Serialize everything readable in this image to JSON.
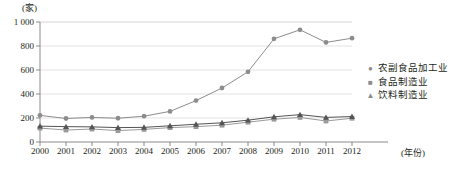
{
  "chart_data": {
    "type": "line",
    "title": "",
    "xlabel": "(年份)",
    "ylabel": "(家)",
    "categories": [
      "2000",
      "2001",
      "2002",
      "2003",
      "2004",
      "2005",
      "2006",
      "2007",
      "2008",
      "2009",
      "2010",
      "2011",
      "2012"
    ],
    "ylim": [
      0,
      1000
    ],
    "yticks": [
      "0",
      "200",
      "400",
      "600",
      "800",
      "1 000"
    ],
    "ytick_values": [
      0,
      200,
      400,
      600,
      800,
      1000
    ],
    "grid": true,
    "legend_position": "right",
    "series": [
      {
        "name": "农副食品加工业",
        "marker": "circle",
        "color": "#8d8d8d",
        "values": [
          222,
          196,
          205,
          198,
          215,
          255,
          345,
          450,
          585,
          860,
          935,
          830,
          865
        ]
      },
      {
        "name": "食品制造业",
        "marker": "square",
        "color": "#9a9a9a",
        "values": [
          116,
          100,
          108,
          95,
          105,
          120,
          128,
          140,
          165,
          190,
          205,
          175,
          198
        ]
      },
      {
        "name": "饮料制造业",
        "marker": "triangle",
        "color": "#555555",
        "values": [
          132,
          128,
          126,
          120,
          122,
          135,
          148,
          160,
          182,
          210,
          228,
          205,
          212
        ]
      }
    ]
  },
  "axis": {
    "y_unit_label": "(家)",
    "x_unit_label": "(年份)"
  },
  "legend": {
    "items": [
      {
        "label": "农副食品加工业",
        "glyph": "●"
      },
      {
        "label": "食品制造业",
        "glyph": "■"
      },
      {
        "label": "饮料制造业",
        "glyph": "▲"
      }
    ]
  }
}
